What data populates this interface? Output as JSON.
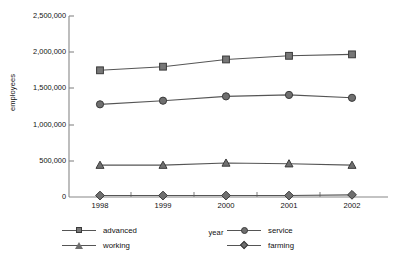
{
  "chart_data": {
    "type": "line",
    "title": "",
    "xlabel": "year",
    "ylabel": "employees",
    "categories": [
      "1998",
      "1999",
      "2000",
      "2001",
      "2002"
    ],
    "ylim": [
      0,
      2500000
    ],
    "ytick_values": [
      0,
      500000,
      1000000,
      1500000,
      2000000,
      2500000
    ],
    "ytick_labels": [
      "0",
      "500,000",
      "1,000,000",
      "1,500,000",
      "2,000,000",
      "2,500,000"
    ],
    "grid": false,
    "legend_position": "below-axis",
    "series": [
      {
        "name": "advanced",
        "marker": "square",
        "color": "#777777",
        "values": [
          1750000,
          1800000,
          1900000,
          1950000,
          1970000
        ]
      },
      {
        "name": "service",
        "marker": "circle",
        "color": "#6f6f6f",
        "values": [
          1280000,
          1330000,
          1390000,
          1410000,
          1370000
        ]
      },
      {
        "name": "working",
        "marker": "triangle",
        "color": "#6f6f6f",
        "values": [
          440000,
          440000,
          470000,
          460000,
          440000
        ]
      },
      {
        "name": "farming",
        "marker": "diamond",
        "color": "#6f6f6f",
        "values": [
          20000,
          20000,
          20000,
          20000,
          30000
        ]
      }
    ]
  },
  "axes": {
    "y_title": "employees",
    "x_title": "year"
  },
  "legend": {
    "items": [
      {
        "label": "advanced",
        "marker": "square"
      },
      {
        "label": "working",
        "marker": "triangle"
      },
      {
        "label": "service",
        "marker": "circle"
      },
      {
        "label": "farming",
        "marker": "diamond"
      }
    ]
  }
}
